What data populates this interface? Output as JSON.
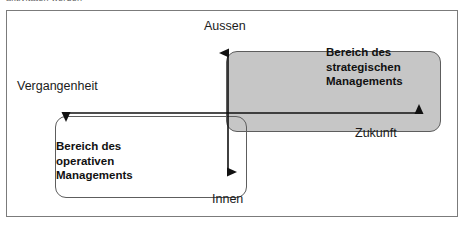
{
  "figure": {
    "clipped_caption": "aktivitäten werden",
    "type": "2x2 orientation diagram",
    "colors": {
      "strategic_fill": "#c6c6c6",
      "operative_fill": "#ffffff",
      "line": "#1b1b1b",
      "frame": "#7b7b7b"
    }
  },
  "axes": {
    "vertical": {
      "top_label": "Aussen",
      "bottom_label": "Innen"
    },
    "horizontal": {
      "left_label": "Vergangenheit",
      "right_label": "Zukunft"
    }
  },
  "regions": [
    {
      "id": "strategic",
      "line1": "Bereich des",
      "line2": "strategischen",
      "line3": "Managements"
    },
    {
      "id": "operative",
      "line1": "Bereich des",
      "line2": "operativen",
      "line3": "Managements"
    }
  ]
}
